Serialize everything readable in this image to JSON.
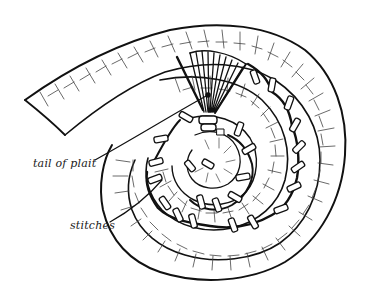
{
  "figure": {
    "colors": {
      "background": "#ffffff",
      "ink": "#111111",
      "texture": "#444444"
    },
    "labels": [
      {
        "id": "tail",
        "text": "tail of plait"
      },
      {
        "id": "stitches",
        "text": "stitches"
      }
    ]
  }
}
